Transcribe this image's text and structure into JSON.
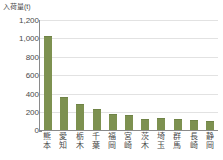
{
  "chart_data": {
    "type": "bar",
    "title": "",
    "subtitle": "",
    "xlabel": "",
    "ylabel": "入荷量(t)",
    "ylim": [
      0,
      1200
    ],
    "ytick_labels": [
      "1,200",
      "1,000",
      "800",
      "600",
      "400",
      "200",
      "0"
    ],
    "ytick_values": [
      1200,
      1000,
      800,
      600,
      400,
      200,
      0
    ],
    "grid": true,
    "legend": null,
    "categories": [
      "熊本",
      "愛知",
      "栃木",
      "千葉",
      "福岡",
      "宮崎",
      "茨木",
      "埼玉",
      "群馬",
      "長崎",
      "静岡"
    ],
    "values": [
      1030,
      355,
      280,
      225,
      175,
      160,
      125,
      128,
      115,
      105,
      95
    ],
    "bar_color": "#7d9150",
    "axis_color": "#8a8a8a",
    "grid_color": "#e2e2e2",
    "text_color": "#4a4a4a",
    "background": "#ffffff"
  }
}
